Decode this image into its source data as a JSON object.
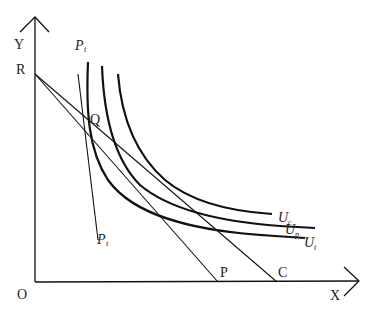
{
  "diagram": {
    "type": "indifference-curve-diagram",
    "axes": {
      "x_label": "X",
      "y_label": "Y",
      "origin_label": "O"
    },
    "points": {
      "R": "R",
      "Q": "Q",
      "P": "P",
      "C": "C"
    },
    "lines": {
      "pt_top_main": "P",
      "pt_top_sub": "t",
      "pt_bottom_main": "P",
      "pt_bottom_sub": "t"
    },
    "curves": [
      {
        "main": "U",
        "sub": "c"
      },
      {
        "main": "U",
        "sub": "p"
      },
      {
        "main": "U",
        "sub": "t"
      }
    ],
    "colors": {
      "ink": "#111111",
      "background": "#ffffff"
    }
  }
}
